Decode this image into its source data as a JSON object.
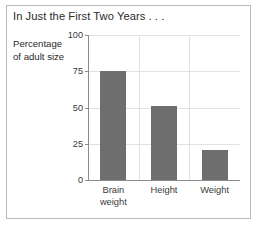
{
  "figure": {
    "title": "In Just the First Two Years . . .",
    "frame_color": "#b9b9b9",
    "background": "#ffffff"
  },
  "chart_data": {
    "type": "bar",
    "title": "In Just the First Two Years . . .",
    "subtitle": "",
    "categories": [
      "Brain weight",
      "Height",
      "Weight"
    ],
    "category_lines": [
      [
        "Brain",
        "weight"
      ],
      [
        "Height",
        ""
      ],
      [
        "Weight",
        ""
      ]
    ],
    "values": [
      75,
      51,
      21
    ],
    "xlabel": "",
    "ylabel": "Percentage of adult size",
    "ylabel_lines": [
      "Percentage",
      "of adult size"
    ],
    "ylim": [
      0,
      100
    ],
    "yticks": [
      0,
      25,
      50,
      75,
      100
    ],
    "ytick_labels": [
      "0",
      "25",
      "50",
      "75",
      "100"
    ],
    "grid": true,
    "grid_color": "#e2e2e2",
    "legend": false,
    "bar_color": "#6e6e6e",
    "axis_color": "#8d8d8d",
    "text_color": "#2b2b2b"
  }
}
